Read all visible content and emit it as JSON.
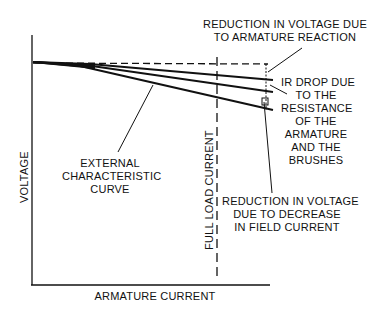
{
  "diagram": {
    "axes": {
      "x_label": "ARMATURE CURRENT",
      "y_label": "VOLTAGE"
    },
    "full_load_label": "FULL LOAD CURRENT",
    "labels": {
      "armature_reaction": "REDUCTION IN VOLTAGE DUE\nTO ARMATURE REACTION",
      "ir_drop": "IR DROP DUE\nTO THE\nRESISTANCE\nOF THE\nARMATURE\nAND THE\nBRUSHES",
      "field_current": "REDUCTION IN VOLTAGE\nDUE TO DECREASE\nIN FIELD CURRENT",
      "external_curve": "EXTERNAL\nCHARACTERISTIC\nCURVE"
    },
    "colors": {
      "ink": "#111111",
      "background": "#ffffff"
    }
  }
}
